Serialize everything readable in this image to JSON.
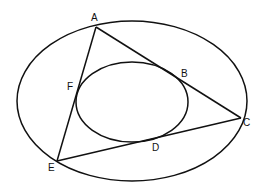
{
  "diagram": {
    "shapes": {
      "outer_ellipse": "circumscribed ellipse through A, C, E",
      "inner_ellipse": "inscribed ellipse tangent to AC at B, CE at D, EA at F",
      "triangle": [
        "A",
        "C",
        "E"
      ]
    },
    "points": {
      "A": "A",
      "B": "B",
      "C": "C",
      "D": "D",
      "E": "E",
      "F": "F"
    },
    "colors": {
      "stroke": "#111111",
      "background": "#ffffff"
    }
  }
}
